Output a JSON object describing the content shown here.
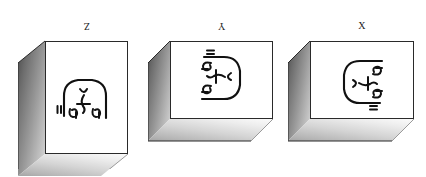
{
  "canvas": {
    "width": 426,
    "height": 177,
    "background": "#ffffff"
  },
  "diagram": {
    "type": "three-projection-boxes",
    "stroke_color": "#2a2a2a",
    "face_color": "#ffffff",
    "shadow_dark": "#4a4a4a",
    "shadow_light": "#fbfbfb",
    "glyph_color": "#111111"
  },
  "boxes": [
    {
      "id": "box-z",
      "label": "Z",
      "label_rotated": true,
      "orientation": "portrait",
      "glyph_rotation_deg": 0,
      "position": {
        "left": 18,
        "top": 20,
        "width": 110,
        "height": 135
      },
      "front": {
        "x": 27,
        "y": 7,
        "w": 83,
        "h": 113
      },
      "depth_x": 27,
      "depth_y": 22
    },
    {
      "id": "box-y",
      "label": "Y",
      "label_rotated": true,
      "orientation": "landscape",
      "glyph_rotation_deg": 90,
      "position": {
        "left": 148,
        "top": 20,
        "width": 125,
        "height": 110
      },
      "front": {
        "x": 22,
        "y": 7,
        "w": 103,
        "h": 78
      },
      "depth_x": 22,
      "depth_y": 22
    },
    {
      "id": "box-x",
      "label": "X",
      "label_rotated": false,
      "orientation": "landscape",
      "glyph_rotation_deg": 270,
      "position": {
        "left": 288,
        "top": 20,
        "width": 128,
        "height": 110
      },
      "front": {
        "x": 22,
        "y": 7,
        "w": 104,
        "h": 78
      },
      "depth_x": 22,
      "depth_y": 22
    }
  ],
  "glyph_cluster": {
    "name": "script-glyph-cluster",
    "note": "Identical handwritten script mark repeated in all three boxes; only the rotation differs",
    "strokes": 9
  }
}
